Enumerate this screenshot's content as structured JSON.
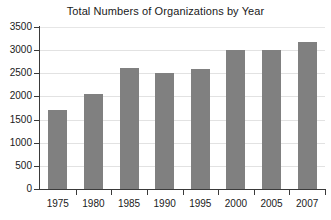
{
  "chart_data": {
    "type": "bar",
    "title": "Total Numbers of Organizations by Year",
    "xlabel": "",
    "ylabel": "",
    "categories": [
      "1975",
      "1980",
      "1985",
      "1990",
      "1995",
      "2000",
      "2005",
      "2007"
    ],
    "values": [
      1700,
      2050,
      2620,
      2500,
      2600,
      3000,
      3000,
      3180
    ],
    "series": [
      {
        "name": "Total Numbers of Organizations",
        "values": [
          1700,
          2050,
          2620,
          2500,
          2600,
          3000,
          3000,
          3180
        ]
      }
    ],
    "ylim": [
      0,
      3500
    ],
    "ytick_labels": [
      "0",
      "500",
      "1000",
      "1500",
      "2000",
      "2500",
      "3000",
      "3500"
    ],
    "ytick_values": [
      0,
      500,
      1000,
      1500,
      2000,
      2500,
      3000,
      3500
    ],
    "grid": true,
    "legend": "none",
    "bar_color": "#808080",
    "grid_color": "#e2e2e2",
    "axis_color": "#3a3a3a",
    "background_color": "#ffffff"
  }
}
